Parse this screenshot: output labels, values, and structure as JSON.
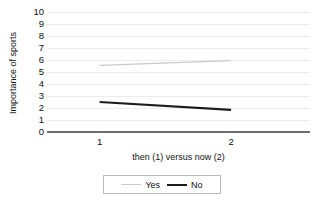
{
  "chart_data": {
    "type": "line",
    "title": "",
    "xlabel": "then (1) versus now (2)",
    "ylabel": "Importance of sports",
    "x": [
      1,
      2
    ],
    "xticklabels": [
      "1",
      "2"
    ],
    "yticklabels": [
      "0",
      "1",
      "2",
      "3",
      "4",
      "5",
      "6",
      "7",
      "8",
      "9",
      "10"
    ],
    "ylim": [
      0,
      10
    ],
    "xlim": [
      0.6,
      2.6
    ],
    "grid": true,
    "legend_position": "bottom",
    "series": [
      {
        "name": "Yes",
        "values": [
          5.55,
          5.95
        ],
        "color": "#c9c9c9",
        "width": 1.4
      },
      {
        "name": "No",
        "values": [
          2.5,
          1.85
        ],
        "color": "#1c1c1c",
        "width": 2.2
      }
    ]
  },
  "legend": {
    "items": [
      {
        "label": "Yes"
      },
      {
        "label": "No"
      }
    ]
  },
  "colors": {
    "axis": "#6d6d6d",
    "grid": "#ececec",
    "series_yes": "#c9c9c9",
    "series_no": "#1c1c1c",
    "text": "#111111"
  }
}
